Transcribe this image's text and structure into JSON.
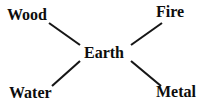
{
  "diagram": {
    "type": "radial-node-link",
    "background_color": "#ffffff",
    "stroke_color": "#161616",
    "text_color": "#0d0d0d",
    "center": {
      "id": "earth",
      "label": "Earth"
    },
    "nodes": [
      {
        "id": "wood",
        "label": "Wood",
        "position": "upper-left"
      },
      {
        "id": "fire",
        "label": "Fire",
        "position": "upper-right"
      },
      {
        "id": "water",
        "label": "Water",
        "position": "lower-left"
      },
      {
        "id": "metal",
        "label": "Metal",
        "position": "lower-right"
      }
    ],
    "edges": [
      {
        "from": "earth",
        "to": "wood",
        "x1": 80,
        "y1": 45,
        "x2": 49,
        "y2": 23
      },
      {
        "from": "earth",
        "to": "fire",
        "x1": 131,
        "y1": 45,
        "x2": 162,
        "y2": 23
      },
      {
        "from": "earth",
        "to": "water",
        "x1": 80,
        "y1": 61,
        "x2": 52,
        "y2": 86
      },
      {
        "from": "earth",
        "to": "metal",
        "x1": 131,
        "y1": 61,
        "x2": 161,
        "y2": 86
      }
    ]
  }
}
